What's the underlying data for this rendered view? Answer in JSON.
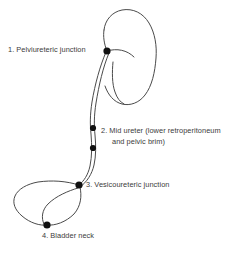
{
  "diagram": {
    "background_color": "#ffffff",
    "stroke_color": "#4a4a4a",
    "dot_color": "#111111",
    "text_color": "#3b3b3b",
    "labels": [
      {
        "number": "1.",
        "text": "1. Pelviureteric junction",
        "dot_x": 107,
        "dot_y": 51
      },
      {
        "number": "2.",
        "line1": "2. Mid ureter (lower retroperitoneum",
        "line2": "and pelvic brim)",
        "dot_x": 93,
        "dot_y": 128,
        "dot2_x": 93,
        "dot2_y": 148
      },
      {
        "number": "3.",
        "text": "3. Vesicoureteric junction",
        "dot_x": 79,
        "dot_y": 185
      },
      {
        "number": "4.",
        "text": "4. Bladder neck",
        "dot_x": 47,
        "dot_y": 225
      }
    ],
    "structures": [
      {
        "name": "kidney",
        "label": "kidney outline"
      },
      {
        "name": "renal-pelvis",
        "label": "renal pelvis"
      },
      {
        "name": "ureter",
        "label": "ureter"
      },
      {
        "name": "bladder",
        "label": "bladder"
      }
    ]
  }
}
